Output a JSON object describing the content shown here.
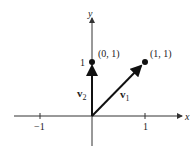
{
  "diagram": {
    "axes": {
      "x_label": "x",
      "y_label": "y",
      "x_ticks": [
        {
          "value": -1,
          "label": "−1"
        },
        {
          "value": 1,
          "label": "1"
        }
      ],
      "y_ticks": [
        {
          "value": 1,
          "label": "1"
        }
      ]
    },
    "vectors": [
      {
        "name": "v1",
        "label_main": "v",
        "label_sub": "1",
        "from": [
          0,
          0
        ],
        "to": [
          1,
          1
        ]
      },
      {
        "name": "v2",
        "label_main": "v",
        "label_sub": "2",
        "from": [
          0,
          0
        ],
        "to": [
          0,
          1
        ]
      }
    ],
    "points": [
      {
        "coords": [
          0,
          1
        ],
        "label": "(0, 1)"
      },
      {
        "coords": [
          1,
          1
        ],
        "label": "(1, 1)"
      }
    ],
    "colors": {
      "axis": "#333333",
      "vector": "#111111",
      "text": "#222222"
    }
  }
}
